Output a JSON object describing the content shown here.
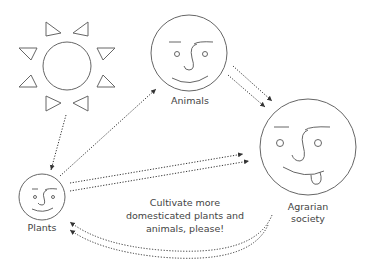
{
  "diagram": {
    "nodes": [
      {
        "id": "sun",
        "label": "",
        "icon": "sun-icon"
      },
      {
        "id": "animals",
        "label": "Animals",
        "icon": "smiley-face-icon"
      },
      {
        "id": "plants",
        "label": "Plants",
        "icon": "smiley-face-icon"
      },
      {
        "id": "agrarian",
        "label_line1": "Agrarian",
        "label_line2": "society",
        "icon": "tongue-out-face-icon"
      }
    ],
    "message": {
      "line1": "Cultivate more",
      "line2": "domesticated plants and",
      "line3": "animals, please!"
    },
    "edges": [
      {
        "from": "sun",
        "to": "plants",
        "style": "dotted"
      },
      {
        "from": "plants",
        "to": "animals",
        "style": "dotted"
      },
      {
        "from": "animals",
        "to": "agrarian",
        "style": "dotted-double"
      },
      {
        "from": "plants",
        "to": "agrarian",
        "style": "dotted-double"
      },
      {
        "from": "agrarian",
        "to": "plants",
        "style": "dotted-double-curved"
      }
    ],
    "colors": {
      "stroke": "#555555",
      "text": "#444444",
      "background": "#ffffff"
    }
  }
}
